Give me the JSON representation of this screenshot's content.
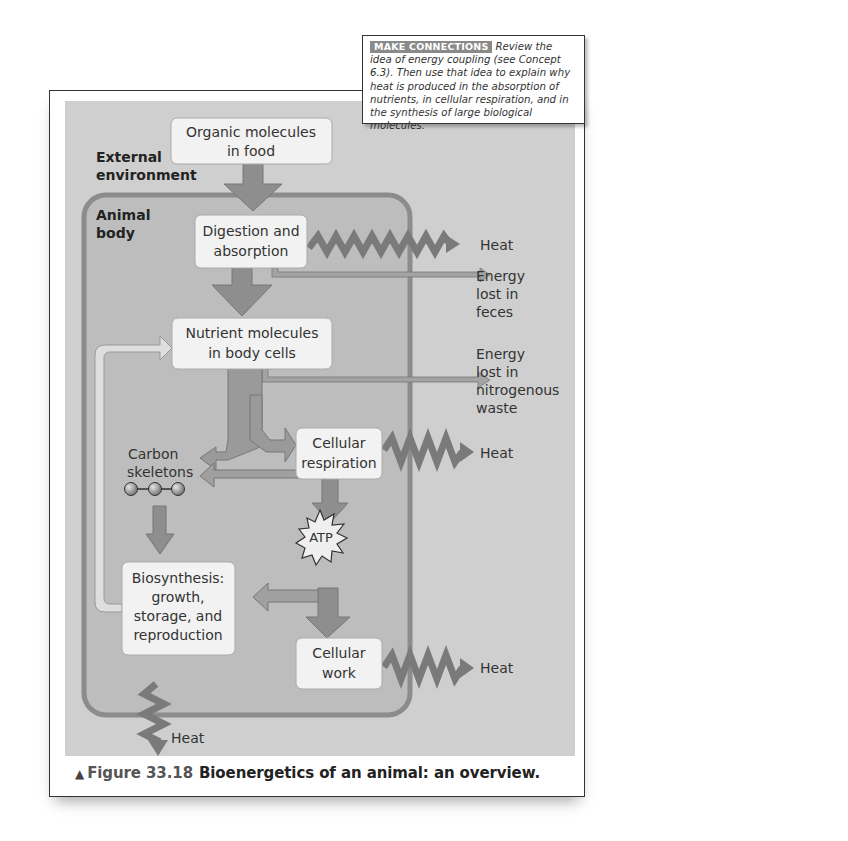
{
  "callout": {
    "tag": "MAKE CONNECTIONS",
    "text": "Review the idea of energy coupling (see Concept 6.3). Then use that idea to explain why heat is produced in the absorption of nutrients, in cellular respiration, and in the synthesis of large biological molecules."
  },
  "diagram": {
    "regions": {
      "external": "External environment",
      "external_line1": "External",
      "external_line2": "environment",
      "animal_line1": "Animal",
      "animal_line2": "body"
    },
    "boxes": {
      "organic_1": "Organic molecules",
      "organic_2": "in food",
      "digestion_1": "Digestion and",
      "digestion_2": "absorption",
      "nutrient_1": "Nutrient molecules",
      "nutrient_2": "in body cells",
      "respiration_1": "Cellular",
      "respiration_2": "respiration",
      "biosynthesis_1": "Biosynthesis:",
      "biosynthesis_2": "growth,",
      "biosynthesis_3": "storage, and",
      "biosynthesis_4": "reproduction",
      "work_1": "Cellular",
      "work_2": "work"
    },
    "labels": {
      "carbon_1": "Carbon",
      "carbon_2": "skeletons",
      "atp": "ATP",
      "heat_digestion": "Heat",
      "feces_1": "Energy",
      "feces_2": "lost in",
      "feces_3": "feces",
      "nitro_1": "Energy",
      "nitro_2": "lost in",
      "nitro_3": "nitrogenous",
      "nitro_4": "waste",
      "heat_respiration": "Heat",
      "heat_work": "Heat",
      "heat_biosynthesis": "Heat"
    },
    "colors": {
      "panel": "#cfcfcf",
      "body": "#bdbdbd",
      "body_border": "#8c8c8c",
      "arrow_dark": "#8e8e8e",
      "arrow_light": "#dedede",
      "zigzag": "#7a7a7a",
      "box": "#f2f2f2"
    }
  },
  "caption": {
    "marker": "▲",
    "figure_number": "Figure 33.18",
    "title": "Bioenergetics of an animal: an overview."
  }
}
